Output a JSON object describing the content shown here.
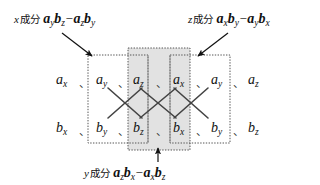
{
  "figure": {
    "type": "cross-product-mnemonic-diagram",
    "colors": {
      "background": "#ffffff",
      "ink": "#111111",
      "shaded_box_fill": "#e2e2e2",
      "box_border": "#555555",
      "cross_line": "#444444"
    }
  },
  "captions": {
    "x_component": {
      "prefix": "x",
      "kanji": "成分",
      "terms": [
        {
          "a": "a",
          "asub": "y",
          "b": "b",
          "bsub": "z"
        },
        {
          "a": "a",
          "asub": "z",
          "b": "b",
          "bsub": "y"
        }
      ],
      "operator": "−",
      "full_text": "x 成分 aybz − azby"
    },
    "z_component": {
      "prefix": "z",
      "kanji": "成分",
      "terms": [
        {
          "a": "a",
          "asub": "x",
          "b": "b",
          "bsub": "y"
        },
        {
          "a": "a",
          "asub": "y",
          "b": "b",
          "bsub": "x"
        }
      ],
      "operator": "−",
      "full_text": "z 成分 axby − aybx"
    },
    "y_component": {
      "prefix": "y",
      "kanji": "成分",
      "terms": [
        {
          "a": "a",
          "asub": "z",
          "b": "b",
          "bsub": "x"
        },
        {
          "a": "a",
          "asub": "x",
          "b": "b",
          "bsub": "z"
        }
      ],
      "operator": "−",
      "full_text": "y 成分 azbx − axbz"
    }
  },
  "grid": {
    "row_a": {
      "symbol": "a",
      "subscripts": [
        "x",
        "y",
        "z",
        "x",
        "y",
        "z"
      ]
    },
    "row_b": {
      "symbol": "b",
      "subscripts": [
        "x",
        "y",
        "z",
        "x",
        "y",
        "z"
      ]
    },
    "separator": "、",
    "separator_count": 5,
    "cross_count": 3
  },
  "boxes": [
    {
      "name": "x-component-box",
      "shaded": false,
      "columns": [
        1,
        2
      ]
    },
    {
      "name": "y-component-box",
      "shaded": true,
      "columns": [
        2,
        3
      ]
    },
    {
      "name": "z-component-box",
      "shaded": false,
      "columns": [
        3,
        4
      ]
    }
  ],
  "arrows": [
    {
      "name": "x-component-arrow",
      "direction": "down-right"
    },
    {
      "name": "z-component-arrow",
      "direction": "down-left"
    },
    {
      "name": "y-component-arrow",
      "direction": "up"
    }
  ]
}
